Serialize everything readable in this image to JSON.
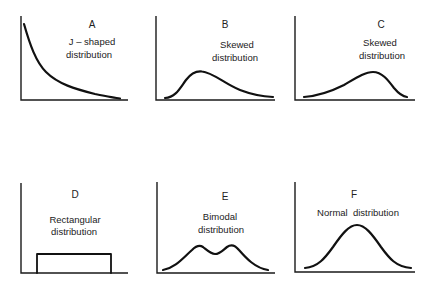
{
  "figure": {
    "panels": [
      {
        "letter": "A",
        "lines": [
          "J – shaped",
          "distribution"
        ],
        "shape": "j-shaped"
      },
      {
        "letter": "B",
        "lines": [
          "Skewed",
          "distribution"
        ],
        "shape": "right-skewed"
      },
      {
        "letter": "C",
        "lines": [
          "Skewed",
          "distribution"
        ],
        "shape": "left-skewed"
      },
      {
        "letter": "D",
        "lines": [
          "Rectangular",
          "distribution"
        ],
        "shape": "rectangular"
      },
      {
        "letter": "E",
        "lines": [
          "Bimodal",
          "distribution"
        ],
        "shape": "bimodal"
      },
      {
        "letter": "F",
        "lines": [
          "Normal  distribution"
        ],
        "shape": "normal"
      }
    ],
    "colors": {
      "line": "#111111",
      "background": "#ffffff",
      "text": "#222222"
    }
  }
}
